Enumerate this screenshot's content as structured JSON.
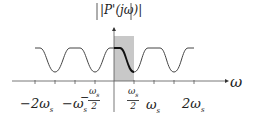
{
  "diagram": {
    "ylabel": "|P'(jω)|",
    "xlabel": "ω",
    "ticks": [
      "−2ω_s",
      "−ω_s",
      "−ω_s/2",
      "ω_s/2",
      "ω_s",
      "2ω_s"
    ],
    "tick_labels": {
      "neg2ws": "−2ω",
      "neg2ws_sub": "s",
      "negws": "−ω",
      "negws_sub": "s",
      "negwshalf_num": "ω",
      "negwshalf_sub": "s",
      "negwshalf_den": "2",
      "negwshalf_sign": "−",
      "poswshalf_num": "ω",
      "poswshalf_sub": "s",
      "poswshalf_den": "2",
      "ws": "ω",
      "ws_sub": "s",
      "pos2ws": "2ω",
      "pos2ws_sub": "s"
    },
    "shade_color": "#c8c8c8",
    "curve_color": "#333333"
  }
}
